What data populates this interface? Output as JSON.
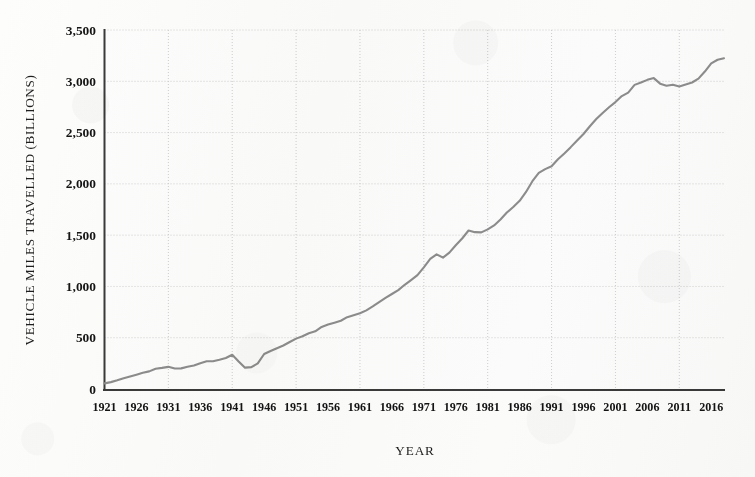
{
  "chart_data": {
    "type": "line",
    "title": "",
    "xlabel": "YEAR",
    "ylabel": "VEHICLE MILES TRAVELLED (BILLIONS)",
    "xlim": [
      1921,
      2018
    ],
    "ylim": [
      0,
      3500
    ],
    "grid": true,
    "legend": "none",
    "units": "billions of vehicle miles",
    "y_ticks": [
      0,
      500,
      1000,
      1500,
      2000,
      2500,
      3000,
      3500
    ],
    "y_tick_labels": [
      "0",
      "500",
      "1,000",
      "1,500",
      "2,000",
      "2,500",
      "3,000",
      "3,500"
    ],
    "x_ticks": [
      1921,
      1926,
      1931,
      1936,
      1941,
      1946,
      1951,
      1956,
      1961,
      1966,
      1971,
      1976,
      1981,
      1986,
      1991,
      1996,
      2001,
      2006,
      2011,
      2016
    ],
    "x_tick_labels": [
      "1921",
      "1926",
      "1931",
      "1936",
      "1941",
      "1946",
      "1951",
      "1956",
      "1961",
      "1966",
      "1971",
      "1976",
      "1981",
      "1986",
      "1991",
      "1996",
      "2001",
      "2006",
      "2011",
      "2016"
    ],
    "series_name": "Vehicle Miles Travelled",
    "line_color": "#8a8a8a",
    "x": [
      1921,
      1922,
      1923,
      1924,
      1925,
      1926,
      1927,
      1928,
      1929,
      1930,
      1931,
      1932,
      1933,
      1934,
      1935,
      1936,
      1937,
      1938,
      1939,
      1940,
      1941,
      1942,
      1943,
      1944,
      1945,
      1946,
      1947,
      1948,
      1949,
      1950,
      1951,
      1952,
      1953,
      1954,
      1955,
      1956,
      1957,
      1958,
      1959,
      1960,
      1961,
      1962,
      1963,
      1964,
      1965,
      1966,
      1967,
      1968,
      1969,
      1970,
      1971,
      1972,
      1973,
      1974,
      1975,
      1976,
      1977,
      1978,
      1979,
      1980,
      1981,
      1982,
      1983,
      1984,
      1985,
      1986,
      1987,
      1988,
      1989,
      1990,
      1991,
      1992,
      1993,
      1994,
      1995,
      1996,
      1997,
      1998,
      1999,
      2000,
      2001,
      2002,
      2003,
      2004,
      2005,
      2006,
      2007,
      2008,
      2009,
      2010,
      2011,
      2012,
      2013,
      2014,
      2015,
      2016,
      2017,
      2018
    ],
    "y": [
      55,
      67,
      85,
      105,
      122,
      140,
      158,
      172,
      198,
      206,
      216,
      200,
      201,
      216,
      229,
      252,
      270,
      271,
      285,
      302,
      334,
      268,
      208,
      213,
      250,
      341,
      371,
      398,
      424,
      458,
      491,
      514,
      544,
      562,
      605,
      628,
      647,
      665,
      700,
      719,
      738,
      767,
      805,
      846,
      888,
      926,
      964,
      1016,
      1062,
      1110,
      1186,
      1268,
      1313,
      1281,
      1330,
      1402,
      1467,
      1545,
      1529,
      1527,
      1556,
      1595,
      1653,
      1720,
      1775,
      1835,
      1921,
      2026,
      2107,
      2144,
      2172,
      2240,
      2296,
      2358,
      2423,
      2486,
      2562,
      2632,
      2691,
      2747,
      2797,
      2856,
      2890,
      2965,
      2989,
      3014,
      3031,
      2977,
      2957,
      2967,
      2950,
      2969,
      2988,
      3026,
      3095,
      3174,
      3210,
      3225
    ]
  }
}
